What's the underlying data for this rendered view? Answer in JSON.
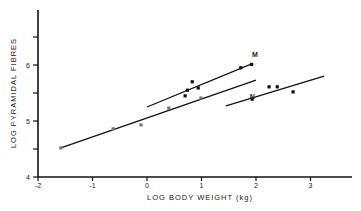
{
  "chart_data": {
    "type": "scatter",
    "title": "",
    "xlabel": "LOG BODY WEIGHT (kg)",
    "ylabel": "LOG PYRAMIDAL FIBRES",
    "xlim": [
      -2,
      3.8
    ],
    "ylim": [
      4,
      7.0
    ],
    "xticks": [
      -2,
      -1,
      0,
      1,
      2,
      3
    ],
    "xtick_labels": [
      "-2",
      "-1",
      "0",
      "1",
      "2",
      "3"
    ],
    "yticks": [
      4,
      4.5,
      5,
      5.5,
      6,
      6.5
    ],
    "ytick_labels": [
      "4",
      "",
      "5",
      "",
      "6",
      ""
    ],
    "grid": false,
    "legend": null,
    "series": [
      {
        "name": "Group A (gray points, long lower-left line)",
        "color": "#777777",
        "points": [
          [
            -1.58,
            4.52
          ],
          [
            -0.62,
            4.86
          ],
          [
            -0.11,
            4.93
          ],
          [
            0.4,
            5.23
          ],
          [
            0.99,
            5.41
          ]
        ]
      },
      {
        "name": "Group B (black points, upper line)",
        "color": "#111111",
        "points": [
          [
            0.83,
            5.7
          ],
          [
            0.74,
            5.55
          ],
          [
            0.94,
            5.59
          ],
          [
            0.7,
            5.45
          ],
          [
            1.72,
            5.95
          ],
          [
            1.92,
            6.01
          ]
        ]
      },
      {
        "name": "Group C (right group)",
        "color": "#111111",
        "points": [
          [
            1.93,
            5.39
          ],
          [
            2.24,
            5.61
          ],
          [
            2.39,
            5.61
          ],
          [
            2.68,
            5.52
          ]
        ]
      }
    ],
    "regression_lines": [
      {
        "name": "Line A",
        "from": [
          -1.58,
          4.52
        ],
        "to": [
          2.0,
          5.73
        ]
      },
      {
        "name": "Line B",
        "from": [
          0.0,
          5.25
        ],
        "to": [
          1.92,
          6.02
        ]
      },
      {
        "name": "Line C",
        "from": [
          1.45,
          5.27
        ],
        "to": [
          3.25,
          5.8
        ]
      }
    ],
    "annotations": [
      {
        "text": "M",
        "x": 1.98,
        "y": 6.15
      },
      {
        "text": "N",
        "x": 1.93,
        "y": 5.39
      }
    ]
  }
}
